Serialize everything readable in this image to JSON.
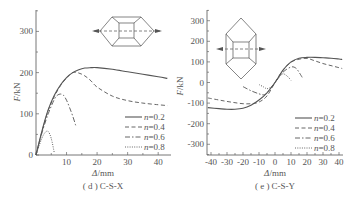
{
  "chart_data": [
    {
      "type": "line",
      "title": "",
      "caption": "(d) C-S-X",
      "caption_tag": "( d )",
      "caption_name": "C-S-X",
      "xlabel": "Δ/mm",
      "ylabel": "F/kN",
      "xlim": [
        0,
        44
      ],
      "ylim": [
        0,
        350
      ],
      "xticks": [
        10,
        20,
        30,
        40
      ],
      "yticks": [
        0,
        100,
        200,
        300
      ],
      "grid": false,
      "legend_position": "lower right",
      "inset": "horizontal hexagonal joint with horizontal dashed load line and arrows",
      "series": [
        {
          "name": "n=0.2",
          "style": "solid",
          "x": [
            0,
            2,
            4,
            6,
            8,
            10,
            12,
            14,
            16,
            18,
            20,
            25,
            30,
            35,
            40,
            43
          ],
          "y": [
            0,
            60,
            110,
            145,
            170,
            188,
            200,
            207,
            211,
            212,
            212,
            208,
            202,
            196,
            190,
            186
          ]
        },
        {
          "name": "n=0.4",
          "style": "dashed",
          "x": [
            0,
            2,
            4,
            6,
            8,
            10,
            12,
            14,
            16,
            18,
            20,
            25,
            30,
            35,
            40,
            43
          ],
          "y": [
            0,
            58,
            108,
            142,
            168,
            187,
            200,
            199,
            192,
            180,
            165,
            143,
            132,
            126,
            122,
            120
          ]
        },
        {
          "name": "n=0.6",
          "style": "dash-dot",
          "x": [
            0,
            2,
            4,
            6,
            7,
            8,
            9,
            10,
            11,
            12,
            13
          ],
          "y": [
            0,
            55,
            100,
            135,
            145,
            148,
            145,
            133,
            115,
            95,
            72
          ]
        },
        {
          "name": "n=0.8",
          "style": "dotted",
          "x": [
            0,
            1,
            2,
            3,
            4,
            5,
            6
          ],
          "y": [
            0,
            22,
            42,
            55,
            57,
            40,
            5
          ]
        }
      ]
    },
    {
      "type": "line",
      "title": "",
      "caption": "(e) C-S-Y",
      "caption_tag": "( e )",
      "caption_name": "C-S-Y",
      "xlabel": "Δ/mm",
      "ylabel": "F/kN",
      "xlim": [
        -42,
        42
      ],
      "ylim": [
        -350,
        350
      ],
      "xticks": [
        -40,
        -30,
        -20,
        -10,
        0,
        10,
        20,
        30,
        40
      ],
      "yticks": [
        -300,
        -200,
        -100,
        0,
        100,
        200,
        300
      ],
      "grid": false,
      "legend_position": "lower right",
      "inset": "vertical hexagonal joint with horizontal dashed load line and arrows",
      "series": [
        {
          "name": "n=0.2",
          "style": "solid",
          "x": [
            -42,
            -35,
            -30,
            -25,
            -20,
            -15,
            -10,
            -5,
            0,
            5,
            10,
            15,
            20,
            25,
            30,
            35,
            40,
            42
          ],
          "y": [
            -122,
            -127,
            -130,
            -130,
            -125,
            -110,
            -85,
            -50,
            0,
            60,
            100,
            118,
            122,
            122,
            120,
            118,
            114,
            112
          ]
        },
        {
          "name": "n=0.4",
          "style": "dashed",
          "x": [
            -42,
            -35,
            -30,
            -25,
            -20,
            -15,
            -10,
            -5,
            0,
            5,
            10,
            15,
            20,
            25,
            30,
            35,
            40,
            42
          ],
          "y": [
            -75,
            -85,
            -92,
            -98,
            -103,
            -103,
            -95,
            -65,
            0,
            60,
            98,
            113,
            117,
            105,
            92,
            82,
            72,
            68
          ]
        },
        {
          "name": "n=0.6",
          "style": "dash-dot",
          "x": [
            -20,
            -15,
            -10,
            -7,
            -5,
            0,
            5,
            10,
            13,
            15,
            17
          ],
          "y": [
            -20,
            -40,
            -55,
            -60,
            -50,
            0,
            50,
            75,
            70,
            50,
            25
          ]
        },
        {
          "name": "n=0.8",
          "style": "dotted",
          "x": [
            -10,
            -7,
            -5,
            -2,
            0,
            3,
            5,
            7,
            9,
            10
          ],
          "y": [
            -10,
            -22,
            -30,
            -20,
            0,
            30,
            42,
            35,
            20,
            10
          ]
        }
      ]
    }
  ],
  "legend": {
    "labels": [
      "n=0.2",
      "n=0.4",
      "n=0.6",
      "n=0.8"
    ],
    "prefix": "n",
    "values": [
      "=0.2",
      "=0.4",
      "=0.6",
      "=0.8"
    ]
  },
  "colors": {
    "line": "#555555",
    "axis": "#666666",
    "text": "#555555"
  }
}
